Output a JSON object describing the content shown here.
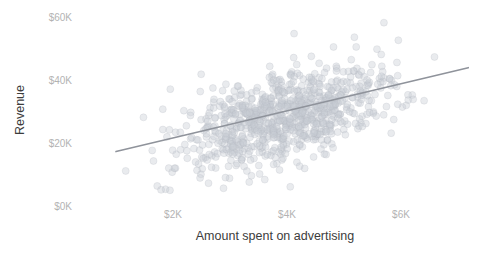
{
  "chart_data": {
    "type": "scatter",
    "title": "",
    "xlabel": "Amount spent on advertising",
    "ylabel": "Revenue",
    "xlim": [
      600,
      7400
    ],
    "ylim": [
      0,
      63000
    ],
    "grid": false,
    "legend": null,
    "x_ticks": [
      {
        "value": 2000,
        "label": "$2K"
      },
      {
        "value": 4000,
        "label": "$4K"
      },
      {
        "value": 6000,
        "label": "$6K"
      }
    ],
    "y_ticks": [
      {
        "value": 0,
        "label": "$0K"
      },
      {
        "value": 20000,
        "label": "$20K"
      },
      {
        "value": 40000,
        "label": "$40K"
      },
      {
        "value": 60000,
        "label": "$60K"
      }
    ],
    "marker": {
      "shape": "circle",
      "radius_px": 3.5,
      "fill": "#c9cdd4",
      "fill_opacity": 0.4,
      "stroke": "#aeb4bd"
    },
    "trendline": {
      "type": "linear",
      "color": "#8f939b",
      "x_start": 1000,
      "y_start": 17500,
      "x_end": 7180,
      "y_end": 44000
    },
    "n_points": 900,
    "correlation": 0.55,
    "series": [
      {
        "name": "Revenue vs advertising spend",
        "color": "#c9cdd4",
        "x_mean": 4000,
        "x_sd": 900,
        "y_mean": 28500,
        "y_sd": 8200
      }
    ]
  },
  "axes": {
    "y_title": "Revenue",
    "x_title": "Amount spent on advertising"
  },
  "colors": {
    "background": "#ffffff",
    "tick_text": "#b3b3b3",
    "axis_title_text": "#3c3c3c",
    "point": "#c9cdd4",
    "trendline": "#8f939b"
  }
}
